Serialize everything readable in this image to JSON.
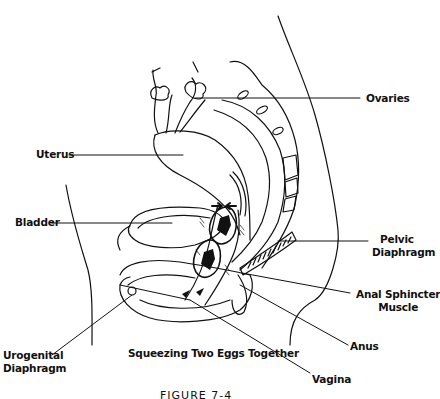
{
  "diagram": {
    "subtitle": "Squeezing Two Eggs Together",
    "caption": "FIGURE 7-4",
    "labels": {
      "ovaries": "Ovaries",
      "uterus": "Uterus",
      "bladder": "Bladder",
      "pelvic_diaphragm_line1": "Pelvic",
      "pelvic_diaphragm_line2": "Diaphragm",
      "anal_sphincter_line1": "Anal Sphincter",
      "anal_sphincter_line2": "Muscle",
      "anus": "Anus",
      "urogenital_line1": "Urogenital",
      "urogenital_line2": "Diaphragm",
      "vagina": "Vagina"
    },
    "colors": {
      "ink": "#111111",
      "background": "#ffffff"
    }
  }
}
